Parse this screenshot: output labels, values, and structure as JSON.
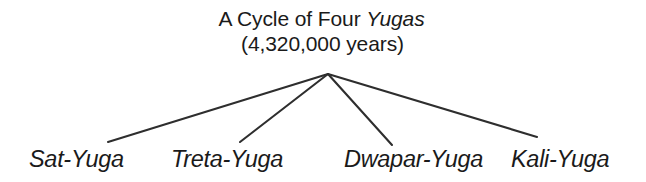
{
  "figure": {
    "title": {
      "line1_prefix": "A Cycle of Four ",
      "line1_emphasis": "Yugas",
      "line2": "(4,320,000 years)"
    },
    "root": {
      "label": "A Cycle of Four Yugas",
      "duration": "4,320,000 years"
    },
    "leaves": [
      {
        "label": "Sat-Yuga"
      },
      {
        "label": "Treta-Yuga"
      },
      {
        "label": "Dwapar-Yuga"
      },
      {
        "label": "Kali-Yuga"
      }
    ],
    "colors": {
      "background": "#ffffff",
      "text": "#1a1a1a",
      "line": "#2e2e2e"
    },
    "geometry": {
      "apex": {
        "x": 328,
        "y": 74
      },
      "endpoints": [
        {
          "x": 108,
          "y": 142
        },
        {
          "x": 240,
          "y": 142
        },
        {
          "x": 392,
          "y": 145
        },
        {
          "x": 537,
          "y": 137
        }
      ]
    }
  }
}
